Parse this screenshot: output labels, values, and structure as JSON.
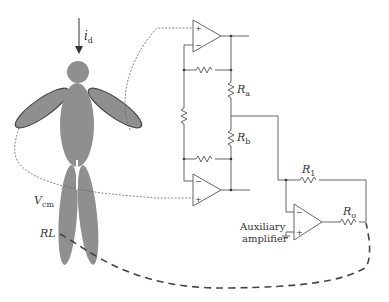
{
  "diagram": {
    "labels": {
      "current": "i",
      "current_sub": "d",
      "vcm": "V",
      "vcm_sub": "cm",
      "rl": "RL",
      "ra": "R",
      "ra_sub": "a",
      "rb": "R",
      "rb_sub": "b",
      "r1": "R",
      "r1_sub": "1",
      "ro": "R",
      "ro_sub": "o",
      "aux_line1": "Auxiliary",
      "aux_line2": "amplifier",
      "plus": "+",
      "minus": "−"
    },
    "components": [
      {
        "id": "opamp-top",
        "type": "op-amp"
      },
      {
        "id": "opamp-bottom",
        "type": "op-amp"
      },
      {
        "id": "opamp-aux",
        "type": "op-amp"
      },
      {
        "id": "resistor-ra",
        "type": "resistor"
      },
      {
        "id": "resistor-rb",
        "type": "resistor"
      },
      {
        "id": "resistor-r1",
        "type": "resistor"
      },
      {
        "id": "resistor-ro",
        "type": "resistor"
      },
      {
        "id": "resistor-gain",
        "type": "resistor"
      },
      {
        "id": "resistor-fb-top",
        "type": "resistor"
      },
      {
        "id": "resistor-fb-bottom",
        "type": "resistor"
      },
      {
        "id": "ground",
        "type": "ground"
      },
      {
        "id": "body",
        "type": "human-figure"
      }
    ],
    "colors": {
      "body_fill": "#8f8f8f",
      "wire": "#555555",
      "text": "#333333"
    }
  }
}
